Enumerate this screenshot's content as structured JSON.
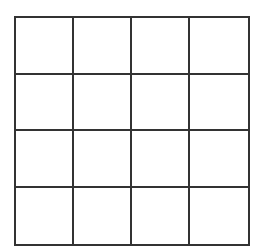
{
  "grid": {
    "rows": 4,
    "cols": 4,
    "line_color": "#333333",
    "background": "#ffffff",
    "cells": [
      [
        "",
        "",
        "",
        ""
      ],
      [
        "",
        "",
        "",
        ""
      ],
      [
        "",
        "",
        "",
        ""
      ],
      [
        "",
        "",
        "",
        ""
      ]
    ]
  }
}
